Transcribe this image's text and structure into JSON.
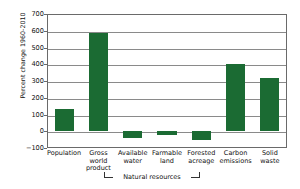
{
  "chart_data": {
    "type": "bar",
    "title": "",
    "xlabel": "",
    "ylabel": "Percent change 1960-2010",
    "categories": [
      "Population",
      "Gross world product",
      "Available water",
      "Farmable land",
      "Forested acreage",
      "Carbon emissions",
      "Solid waste"
    ],
    "category_lines": [
      [
        "Population"
      ],
      [
        "Gross",
        "world",
        "product"
      ],
      [
        "Available",
        "water"
      ],
      [
        "Farmable",
        "land"
      ],
      [
        "Forested",
        "acreage"
      ],
      [
        "Carbon",
        "emissions"
      ],
      [
        "Solid",
        "waste"
      ]
    ],
    "values": [
      130,
      585,
      -40,
      -20,
      -50,
      400,
      320
    ],
    "ylim": [
      -100,
      700
    ],
    "yticks": [
      -100,
      0,
      100,
      200,
      300,
      400,
      500,
      600,
      700
    ],
    "ytick_labels": [
      "−100",
      "0",
      "100",
      "200",
      "300",
      "400",
      "500",
      "600",
      "700"
    ],
    "grid": true,
    "legend": null,
    "annotations": [
      {
        "name": "natural-resources-bracket",
        "text": "Natural resources",
        "spans": [
          "Available water",
          "Farmable land",
          "Forested acreage"
        ]
      }
    ],
    "bar_color": "#1b6b33",
    "axis_color": "#6a6a6a",
    "grid_color": "#8a8a8a",
    "text_color": "#111111"
  }
}
